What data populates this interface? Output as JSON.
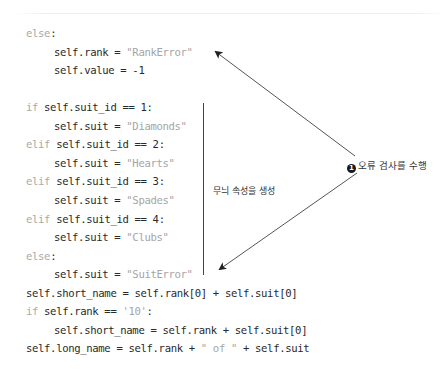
{
  "code_lines": [
    {
      "y": 0,
      "indent": 0,
      "kw": "else",
      "rest": ":",
      "str": "",
      "tail": ""
    },
    {
      "y": 19,
      "indent": 1,
      "kw": "",
      "rest": "self.rank = ",
      "str": "\"RankError\"",
      "tail": ""
    },
    {
      "y": 37,
      "indent": 1,
      "kw": "",
      "rest": "self.value = -1",
      "str": "",
      "tail": ""
    },
    {
      "y": 74,
      "indent": 0,
      "kw": "if",
      "rest": " self.suit_id == 1:",
      "str": "",
      "tail": ""
    },
    {
      "y": 93,
      "indent": 1,
      "kw": "",
      "rest": "self.suit = ",
      "str": "\"Diamonds\"",
      "tail": ""
    },
    {
      "y": 111,
      "indent": 0,
      "kw": "elif",
      "rest": " self.suit_id == 2:",
      "str": "",
      "tail": ""
    },
    {
      "y": 130,
      "indent": 1,
      "kw": "",
      "rest": "self.suit = ",
      "str": "\"Hearts\"",
      "tail": ""
    },
    {
      "y": 148,
      "indent": 0,
      "kw": "elif",
      "rest": " self.suit_id == 3:",
      "str": "",
      "tail": ""
    },
    {
      "y": 167,
      "indent": 1,
      "kw": "",
      "rest": "self.suit = ",
      "str": "\"Spades\"",
      "tail": ""
    },
    {
      "y": 186,
      "indent": 0,
      "kw": "elif",
      "rest": " self.suit_id == 4:",
      "str": "",
      "tail": ""
    },
    {
      "y": 204,
      "indent": 1,
      "kw": "",
      "rest": "self.suit = ",
      "str": "\"Clubs\"",
      "tail": ""
    },
    {
      "y": 223,
      "indent": 0,
      "kw": "else",
      "rest": ":",
      "str": "",
      "tail": ""
    },
    {
      "y": 241,
      "indent": 1,
      "kw": "",
      "rest": "self.suit = ",
      "str": "\"SuitError\"",
      "tail": ""
    },
    {
      "y": 260,
      "indent": 0,
      "kw": "",
      "rest": "self.short_name = self.rank[0] + self.suit[0]",
      "str": "",
      "tail": ""
    },
    {
      "y": 278,
      "indent": 0,
      "kw": "if",
      "rest": " self.rank == ",
      "str": "'10'",
      "tail": ":"
    },
    {
      "y": 297,
      "indent": 1,
      "kw": "",
      "rest": "self.short_name = self.rank + self.suit[0]",
      "str": "",
      "tail": ""
    },
    {
      "y": 315,
      "indent": 0,
      "kw": "",
      "rest": "self.long_name = self.rank + ",
      "str": "\" of \"",
      "tail": " + self.suit"
    }
  ],
  "annotations": {
    "error_check": {
      "number": "1",
      "label": "오류 검사를 수행"
    },
    "suit_attr": {
      "label": "무늬 속성을 생성"
    }
  },
  "colors": {
    "code_text": "#2a2a2a",
    "keyword": "#a9a9a9",
    "string": "#a5a5a5",
    "arrow": "#555555"
  }
}
